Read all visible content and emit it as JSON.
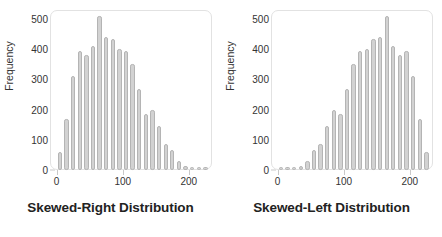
{
  "figure": {
    "background": "#ffffff",
    "bar_fill": "#d2d2d2",
    "bar_stroke": "#b4b4b4",
    "frame_stroke": "#e2e2e2"
  },
  "chart_data": [
    {
      "type": "bar",
      "title": "Skewed-Right Distribution",
      "xlabel": "",
      "ylabel": "Frequency",
      "xlim": [
        -10,
        235
      ],
      "ylim": [
        0,
        530
      ],
      "grid": false,
      "legend": null,
      "xticks": [
        0,
        100,
        200
      ],
      "xtick_labels": [
        "0",
        "100",
        "200"
      ],
      "yticks": [
        0,
        100,
        200,
        300,
        400,
        500
      ],
      "ytick_labels": [
        "0",
        "100",
        "200",
        "300",
        "400",
        "500"
      ],
      "categories": [
        5,
        15,
        25,
        35,
        45,
        55,
        65,
        75,
        85,
        95,
        105,
        115,
        125,
        135,
        145,
        155,
        165,
        175,
        185,
        195,
        205,
        215,
        225
      ],
      "values": [
        60,
        170,
        310,
        395,
        380,
        410,
        510,
        440,
        435,
        400,
        395,
        350,
        270,
        185,
        200,
        145,
        85,
        65,
        30,
        12,
        10,
        10,
        10
      ]
    },
    {
      "type": "bar",
      "title": "Skewed-Left Distribution",
      "xlabel": "",
      "ylabel": "Frequency",
      "xlim": [
        -10,
        235
      ],
      "ylim": [
        0,
        530
      ],
      "grid": false,
      "legend": null,
      "xticks": [
        0,
        100,
        200
      ],
      "xtick_labels": [
        "0",
        "100",
        "200"
      ],
      "yticks": [
        0,
        100,
        200,
        300,
        400,
        500
      ],
      "ytick_labels": [
        "0",
        "100",
        "200",
        "300",
        "400",
        "500"
      ],
      "categories": [
        5,
        15,
        25,
        35,
        45,
        55,
        65,
        75,
        85,
        95,
        105,
        115,
        125,
        135,
        145,
        155,
        165,
        175,
        185,
        195,
        205,
        215,
        225
      ],
      "values": [
        10,
        10,
        10,
        12,
        30,
        65,
        85,
        145,
        200,
        185,
        270,
        350,
        395,
        400,
        435,
        440,
        510,
        410,
        380,
        395,
        310,
        170,
        60
      ]
    }
  ]
}
